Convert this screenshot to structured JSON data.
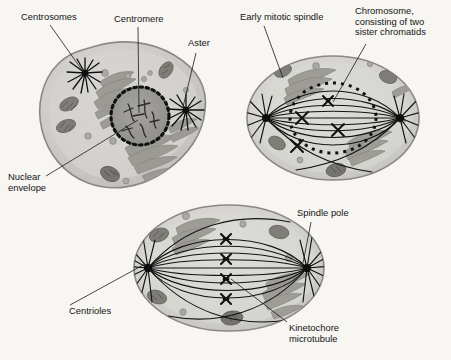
{
  "figure": {
    "background_color": "#f7f6f2",
    "label_color": "#141414"
  },
  "labels": {
    "centrosomes": "Centrosomes",
    "centromere": "Centromere",
    "aster": "Aster",
    "nuclear_envelope_line1": "Nuclear",
    "nuclear_envelope_line2": "envelope",
    "early_mitotic_spindle": "Early mitotic spindle",
    "chromosome_line1": "Chromosome,",
    "chromosome_line2": "consisting of two",
    "chromosome_line3": "sister chromatids",
    "spindle_pole": "Spindle pole",
    "centrioles": "Centrioles",
    "kinetochore_line1": "Kinetochore",
    "kinetochore_line2": "microtubule"
  },
  "cells": [
    {
      "name": "prophase-cell",
      "stage": "Prophase",
      "position": "top-left",
      "features": [
        "centrosomes",
        "aster",
        "nuclear envelope",
        "centromere",
        "chromatin",
        "endoplasmic reticulum",
        "mitochondria",
        "vesicles"
      ]
    },
    {
      "name": "prometaphase-cell",
      "stage": "Prometaphase",
      "position": "top-right",
      "features": [
        "early mitotic spindle",
        "fragmenting nuclear envelope",
        "chromosomes with sister chromatids",
        "spindle poles"
      ],
      "chromosome_count": 4
    },
    {
      "name": "metaphase-cell",
      "stage": "Metaphase",
      "position": "bottom-center",
      "features": [
        "spindle pole",
        "centrioles",
        "kinetochore microtubule",
        "metaphase plate chromosomes"
      ],
      "chromosome_count": 4
    }
  ],
  "colors": {
    "cytoplasm": "#c9c8c4",
    "cytoplasm_light": "#d8d7d3",
    "membrane": "#8d8c88",
    "nucleus_fill": "#9a9995",
    "organelle": "#8e8d88",
    "organelle_dark": "#6d6c68",
    "spindle_fiber": "#1a1a1a",
    "chromosome": "#121212"
  }
}
